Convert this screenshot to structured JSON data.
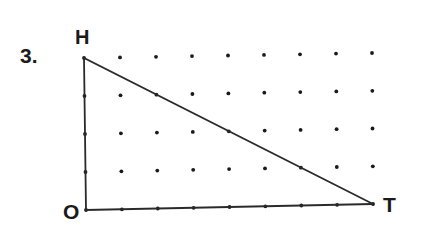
{
  "problem": {
    "number_label": "3.",
    "vertices": [
      {
        "name": "H",
        "x": 84,
        "y": 58
      },
      {
        "name": "O",
        "x": 86,
        "y": 210
      },
      {
        "name": "T",
        "x": 373,
        "y": 204
      }
    ],
    "grid": {
      "columns": 9,
      "rows": 5
    },
    "line_color": "#2a2a2a",
    "dot_color": "#1a1a1a"
  }
}
